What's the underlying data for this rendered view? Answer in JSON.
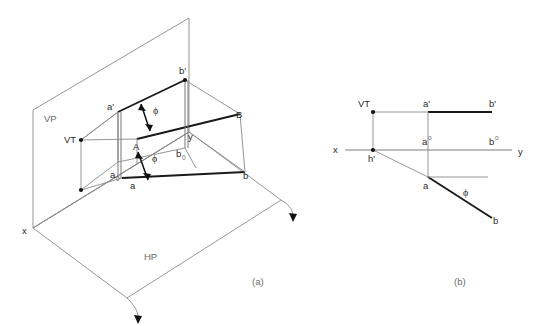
{
  "figure": {
    "title_a": "(a)",
    "title_b": "(b)",
    "stroke_thin": "#8a8a8a",
    "stroke_bold": "#1a1a1a",
    "background": "#ffffff"
  },
  "pictorial": {
    "plane_vp_label": "VP",
    "plane_hp_label": "HP",
    "trace_vt_label": "VT",
    "axis_x_label": "x",
    "axis_y_label": "y",
    "point_a_front": "a'",
    "point_b_front": "b'",
    "point_a_top": "a",
    "point_b_top": "b",
    "point_a_base": "a",
    "point_a_base_sub": "0",
    "point_b_base": "b",
    "point_b_base_sub": "0",
    "point_A": "A",
    "point_B": "B",
    "angle_upper": "ϕ",
    "angle_lower": "ϕ"
  },
  "orthographic": {
    "trace_vt_label": "VT",
    "trace_ht_label": "h'",
    "axis_x_label": "x",
    "axis_y_label": "y",
    "point_a_front": "a'",
    "point_b_front": "b'",
    "point_a_mid": "a",
    "point_a_mid_sup": "o",
    "point_b_mid": "b",
    "point_b_mid_sup": "o",
    "point_a_top": "a",
    "point_b_top": "b",
    "angle_label": "ϕ"
  }
}
